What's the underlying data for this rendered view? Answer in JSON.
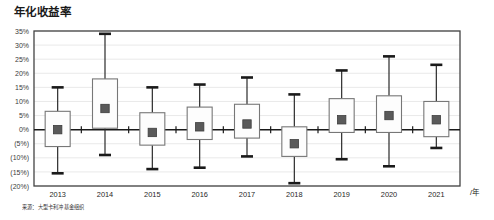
{
  "chart": {
    "title": "年化收益率",
    "source_note": "来源：大型卡利冲基金组织",
    "axis_unit_label": "/年"
  },
  "chart_data": {
    "type": "box",
    "title": "年化收益率",
    "xlabel": "/年",
    "ylabel": "",
    "ylim": [
      -20,
      35
    ],
    "ytick_step": 5,
    "grid": true,
    "legend": "none",
    "negative_format": "parentheses",
    "categories": [
      "2013",
      "2014",
      "2015",
      "2016",
      "2017",
      "2018",
      "2019",
      "2020",
      "2021"
    ],
    "ytick_labels": [
      "35%",
      "30%",
      "25%",
      "20%",
      "15%",
      "10%",
      "5%",
      "0%",
      "(5%)",
      "(10%)",
      "(15%)",
      "(20%)"
    ],
    "ytick_values": [
      35,
      30,
      25,
      20,
      15,
      10,
      5,
      0,
      -5,
      -10,
      -15,
      -20
    ],
    "boxes": [
      {
        "category": "2013",
        "whisker_high": 15.0,
        "q3": 6.5,
        "median": 0.0,
        "q1": -6.0,
        "whisker_low": -15.5
      },
      {
        "category": "2014",
        "whisker_high": 34.0,
        "q3": 18.0,
        "median": 7.5,
        "q1": 0.5,
        "whisker_low": -9.0
      },
      {
        "category": "2015",
        "whisker_high": 15.0,
        "q3": 6.0,
        "median": -1.0,
        "q1": -5.5,
        "whisker_low": -14.0
      },
      {
        "category": "2016",
        "whisker_high": 16.0,
        "q3": 8.0,
        "median": 1.0,
        "q1": -3.5,
        "whisker_low": -13.5
      },
      {
        "category": "2017",
        "whisker_high": 18.5,
        "q3": 9.0,
        "median": 2.0,
        "q1": -3.0,
        "whisker_low": -9.5
      },
      {
        "category": "2018",
        "whisker_high": 12.5,
        "q3": 1.0,
        "median": -5.0,
        "q1": -9.5,
        "whisker_low": -19.0
      },
      {
        "category": "2019",
        "whisker_high": 21.0,
        "q3": 11.0,
        "median": 3.5,
        "q1": -1.0,
        "whisker_low": -10.5
      },
      {
        "category": "2020",
        "whisker_high": 26.0,
        "q3": 12.0,
        "median": 5.0,
        "q1": -1.0,
        "whisker_low": -13.0
      },
      {
        "category": "2021",
        "whisker_high": 23.0,
        "q3": 10.0,
        "median": 3.5,
        "q1": -2.5,
        "whisker_low": -6.5
      }
    ]
  },
  "style": {
    "plot_border": "#444444",
    "gridline": "#e3e3e3",
    "zero_line": "#1a1a1a",
    "box_stroke": "#777777",
    "box_fill": "#fdfdfd",
    "whisker_stroke": "#2b2b2b",
    "cap_stroke": "#1a1a1a",
    "median_marker": "#5a5a5a",
    "text": "#231f20"
  }
}
